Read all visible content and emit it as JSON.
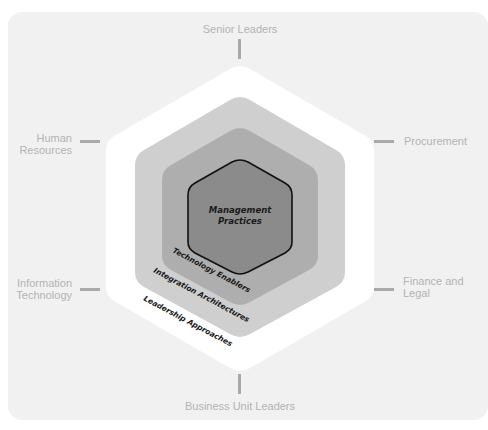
{
  "diagram": {
    "core": {
      "line1": "Management",
      "line2": "Practices",
      "fill": "#8b8b8b"
    },
    "rings": [
      {
        "label": "Technology Enablers",
        "fill": "#aeaeae"
      },
      {
        "label": "Integration Architectures",
        "fill": "#cfcfcf"
      },
      {
        "label": "Leadership Approaches",
        "fill": "#ffffff"
      }
    ],
    "stakeholders": {
      "top": "Senior Leaders",
      "bottom": "Business Unit Leaders",
      "upper_left": {
        "line1": "Human",
        "line2": "Resources"
      },
      "lower_left": {
        "line1": "Information",
        "line2": "Technology"
      },
      "upper_right": "Procurement",
      "lower_right": {
        "line1": "Finance and",
        "line2": "Legal"
      }
    },
    "colors": {
      "background": "#f1f1f1",
      "stakeholder_text": "#b3b3b3",
      "connector": "#a9a9a9"
    }
  }
}
